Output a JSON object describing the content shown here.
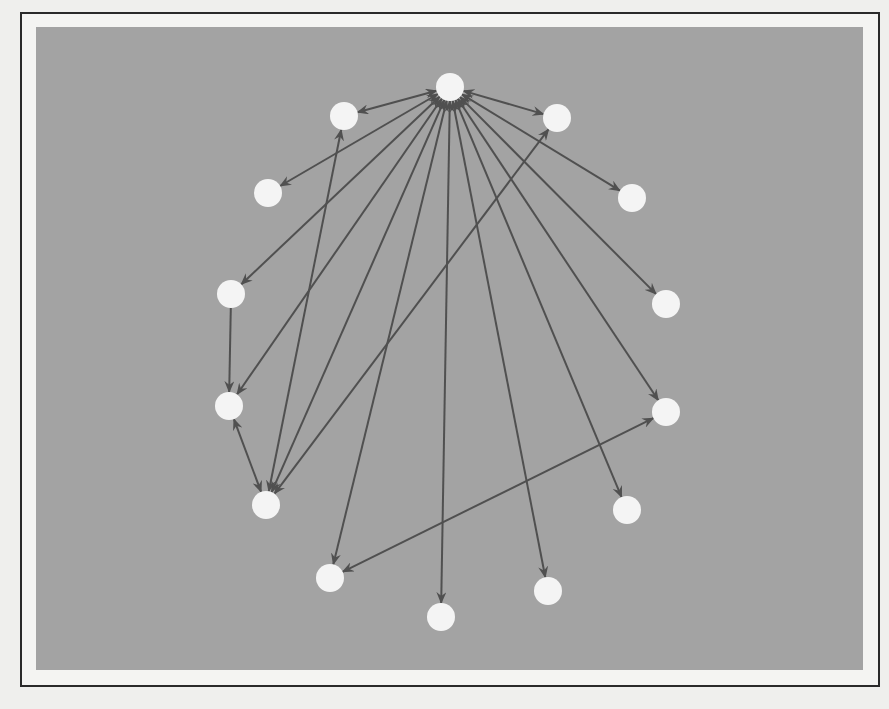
{
  "figure": {
    "type": "directed-graph",
    "layout": "circular",
    "colors": {
      "page_background": "#efefed",
      "frame_border": "#2a2a2a",
      "panel_background": "#a3a3a3",
      "edge": "#505050",
      "node": "#f4f4f4"
    },
    "node_radius": 14,
    "nodes": [
      {
        "id": "n0",
        "x": 450,
        "y": 87,
        "role": "hub"
      },
      {
        "id": "n1",
        "x": 557,
        "y": 118
      },
      {
        "id": "n2",
        "x": 632,
        "y": 198
      },
      {
        "id": "n3",
        "x": 666,
        "y": 304
      },
      {
        "id": "n4",
        "x": 666,
        "y": 412
      },
      {
        "id": "n5",
        "x": 627,
        "y": 510
      },
      {
        "id": "n6",
        "x": 548,
        "y": 591
      },
      {
        "id": "n7",
        "x": 441,
        "y": 617
      },
      {
        "id": "n8",
        "x": 330,
        "y": 578
      },
      {
        "id": "n9",
        "x": 266,
        "y": 505
      },
      {
        "id": "n10",
        "x": 229,
        "y": 406
      },
      {
        "id": "n11",
        "x": 231,
        "y": 294
      },
      {
        "id": "n12",
        "x": 268,
        "y": 193
      },
      {
        "id": "n13",
        "x": 344,
        "y": 116
      }
    ],
    "edges": [
      {
        "from": "n0",
        "to": "n13",
        "bidirectional": true
      },
      {
        "from": "n0",
        "to": "n12",
        "bidirectional": true
      },
      {
        "from": "n0",
        "to": "n11",
        "bidirectional": true
      },
      {
        "from": "n0",
        "to": "n10",
        "bidirectional": true
      },
      {
        "from": "n0",
        "to": "n9",
        "bidirectional": true
      },
      {
        "from": "n0",
        "to": "n8",
        "bidirectional": true
      },
      {
        "from": "n0",
        "to": "n7",
        "bidirectional": true
      },
      {
        "from": "n0",
        "to": "n6",
        "bidirectional": true
      },
      {
        "from": "n0",
        "to": "n5",
        "bidirectional": true
      },
      {
        "from": "n0",
        "to": "n4",
        "bidirectional": true
      },
      {
        "from": "n0",
        "to": "n3",
        "bidirectional": true
      },
      {
        "from": "n0",
        "to": "n2",
        "bidirectional": true
      },
      {
        "from": "n0",
        "to": "n1",
        "bidirectional": true
      },
      {
        "from": "n11",
        "to": "n10",
        "bidirectional": false
      },
      {
        "from": "n10",
        "to": "n9",
        "bidirectional": true
      },
      {
        "from": "n9",
        "to": "n13",
        "bidirectional": true
      },
      {
        "from": "n9",
        "to": "n1",
        "bidirectional": true
      },
      {
        "from": "n8",
        "to": "n4",
        "bidirectional": true
      }
    ]
  }
}
